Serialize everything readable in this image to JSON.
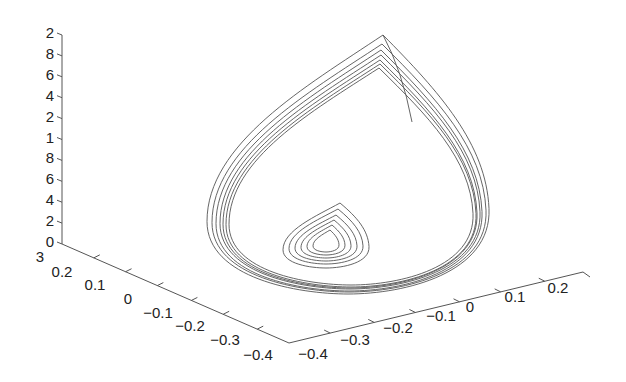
{
  "chart_data": {
    "type": "line",
    "subtype": "3d-trajectory",
    "title": "",
    "xlabel": "",
    "ylabel": "",
    "zlabel": "",
    "grid": false,
    "legend": null,
    "z_axis": {
      "tick_labels": [
        "2",
        "8",
        "6",
        "4",
        "2",
        "1",
        "8",
        "6",
        "4",
        "2",
        "0"
      ],
      "note": "labels appear truncated (leading digits cut off), top-to-bottom order"
    },
    "left_axis": {
      "tick_labels": [
        "3",
        "0.2",
        "0.1",
        "0",
        "−0.1",
        "−0.2",
        "−0.3",
        "−0.4"
      ],
      "range": [
        -0.4,
        0.3
      ]
    },
    "right_axis": {
      "tick_labels": [
        "−0.4",
        "−0.3",
        "−0.2",
        "−0.1",
        "0",
        "0.1",
        "0.2"
      ],
      "range": [
        -0.4,
        0.25
      ]
    },
    "series": [
      {
        "name": "outer teardrop orbits",
        "count": 7,
        "description": "nested teardrop-shaped loops converging toward a limit cycle, cusp at top"
      },
      {
        "name": "inner teardrop spiral",
        "count": 6,
        "description": "small nested teardrop loops near the base center"
      }
    ]
  }
}
